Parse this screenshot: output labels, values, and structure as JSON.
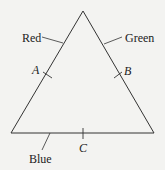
{
  "diagram": {
    "type": "triangle",
    "background": "#f3f3f1",
    "stroke": "#333333",
    "vertices": {
      "top": [
        83,
        11
      ],
      "bottom_left": [
        11,
        133
      ],
      "bottom_right": [
        154,
        133
      ]
    },
    "sides": [
      {
        "name": "left",
        "color_label": "Red",
        "point_label": "A"
      },
      {
        "name": "right",
        "color_label": "Green",
        "point_label": "B"
      },
      {
        "name": "bottom",
        "color_label": "Blue",
        "point_label": "C"
      }
    ]
  }
}
